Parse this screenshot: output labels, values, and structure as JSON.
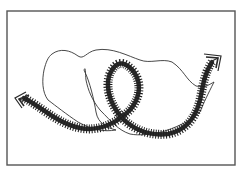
{
  "figure": {
    "colors": {
      "background": "#ffffff",
      "frame": "#555555",
      "thin_curve": "#333333",
      "hatched_path": "#2a2a2a"
    },
    "frame": {
      "x": 7,
      "y": 11,
      "width": 228,
      "height": 154
    },
    "elements": [
      {
        "name": "thin-closed-loop",
        "type": "thin-curve"
      },
      {
        "name": "hatched-path",
        "type": "thick-hatched-curve",
        "ends": [
          "arrow-left",
          "arrow-right"
        ]
      }
    ]
  }
}
